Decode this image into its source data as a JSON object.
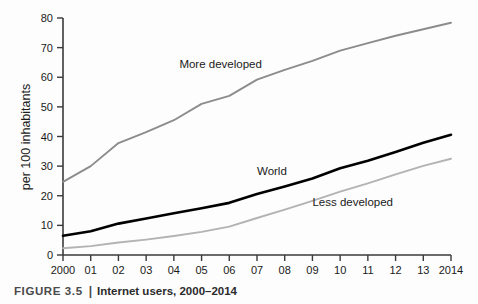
{
  "caption": {
    "figure_label": "FIGURE 3.5",
    "separator": "|",
    "title": "Internet users, 2000–2014"
  },
  "colors": {
    "more_developed": "#8c8c8c",
    "world": "#000000",
    "less_developed": "#b3b3b3",
    "axis": "#3a3a3a",
    "text": "#1a1a1a",
    "caption_figure": "#4a4a4a",
    "background": "#fdfdfd"
  },
  "chart_data": {
    "type": "line",
    "title": "Internet users, 2000–2014",
    "xlabel": "",
    "ylabel": "per 100 inhabitants",
    "ylim": [
      0,
      80
    ],
    "yticks": [
      0,
      10,
      20,
      30,
      40,
      50,
      60,
      70,
      80
    ],
    "ytick_labels": [
      "0",
      "10",
      "20",
      "30",
      "40",
      "50",
      "60",
      "70",
      "80"
    ],
    "grid": false,
    "legend": "inline-labels",
    "x": [
      2000,
      2001,
      2002,
      2003,
      2004,
      2005,
      2006,
      2007,
      2008,
      2009,
      2010,
      2011,
      2012,
      2013,
      2014
    ],
    "categories": [
      "2000",
      "01",
      "02",
      "03",
      "04",
      "05",
      "06",
      "07",
      "08",
      "09",
      "10",
      "11",
      "12",
      "13",
      "2014"
    ],
    "series": [
      {
        "name": "More developed",
        "color": "#8c8c8c",
        "values": [
          24.7,
          30.0,
          37.8,
          41.5,
          45.5,
          51.0,
          53.7,
          59.2,
          62.5,
          65.5,
          69.0,
          71.5,
          74.0,
          76.2,
          78.4
        ]
      },
      {
        "name": "World",
        "color": "#000000",
        "values": [
          6.5,
          8.0,
          10.6,
          12.3,
          14.1,
          15.8,
          17.6,
          20.6,
          23.1,
          25.8,
          29.3,
          31.8,
          34.8,
          37.9,
          40.6
        ]
      },
      {
        "name": "Less developed",
        "color": "#b3b3b3",
        "values": [
          2.3,
          3.0,
          4.2,
          5.2,
          6.4,
          7.8,
          9.6,
          12.5,
          15.3,
          18.3,
          21.4,
          24.2,
          27.2,
          30.1,
          32.5
        ]
      }
    ],
    "annotations": [
      {
        "text": "More developed",
        "x_value": 2004.2,
        "y_value": 63.0
      },
      {
        "text": "World",
        "x_value": 2007.0,
        "y_value": 27.0
      },
      {
        "text": "Less developed",
        "x_value": 2009.0,
        "y_value": 16.5
      }
    ]
  }
}
